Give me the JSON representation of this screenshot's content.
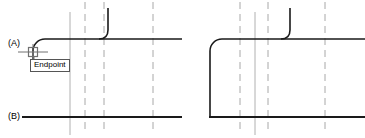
{
  "figure": {
    "width": 365,
    "height": 138,
    "background": "#ffffff"
  },
  "colors": {
    "geometry": "#1a1a1a",
    "centerline": "#a8a8a8",
    "construction_line": "#b0b0b0",
    "tooltip_border": "#555555",
    "tooltip_background": "#ffffff",
    "marker": "#707070",
    "text": "#000000"
  },
  "labels": {
    "point_a": "(A)",
    "point_b": "(B)"
  },
  "tooltip": {
    "text": "Endpoint",
    "visible": true
  },
  "snap": {
    "type": "endpoint-snap-marker",
    "shape": "square",
    "x": 33,
    "y": 52
  },
  "cursor": {
    "type": "crosshair",
    "x": 33,
    "y": 52
  },
  "panels": [
    {
      "name": "panel-before",
      "description": "Open corner with fillet arc being placed; endpoint snap active at lower left",
      "x_origin": 0
    },
    {
      "name": "panel-after",
      "description": "Completed rounded corner joining top and bottom edges",
      "x_origin": 183
    }
  ],
  "geometry": {
    "top_edge_y": 39,
    "bottom_edge_y": 117,
    "left_panel": {
      "fillet_center_x": 45,
      "fillet_center_y": 51,
      "fillet_radius": 12,
      "top_line_start_x": 45,
      "top_line_end_x": 182,
      "bottom_line_start_x": 22,
      "bottom_line_end_x": 182,
      "vertical_stub_x": 33,
      "vertical_stub_top_y": 46,
      "vertical_stub_bottom_y": 60,
      "hook_x": 108,
      "hook_top_y": 8
    },
    "right_panel": {
      "fillet_center_x": 222,
      "fillet_center_y": 51,
      "fillet_radius": 12,
      "left_edge_x": 210,
      "top_line_start_x": 222,
      "top_line_end_x": 365,
      "bottom_line_start_x": 210,
      "bottom_line_end_x": 365,
      "hook_x": 290,
      "hook_top_y": 8
    }
  },
  "centerlines": {
    "dashed": [
      {
        "name": "centerline-left-1",
        "x": 85,
        "y1": 2,
        "y2": 130
      },
      {
        "name": "centerline-left-2",
        "x": 104,
        "y1": 2,
        "y2": 130
      },
      {
        "name": "centerline-left-3",
        "x": 153,
        "y1": 2,
        "y2": 130
      },
      {
        "name": "centerline-right-1",
        "x": 240,
        "y1": 2,
        "y2": 130
      },
      {
        "name": "centerline-right-2",
        "x": 268,
        "y1": 2,
        "y2": 130
      },
      {
        "name": "centerline-right-3",
        "x": 325,
        "y1": 2,
        "y2": 130
      }
    ],
    "solid": [
      {
        "name": "construction-line-left",
        "x": 70,
        "y1": 12,
        "y2": 135
      },
      {
        "name": "construction-line-right",
        "x": 255,
        "y1": 12,
        "y2": 135
      }
    ]
  }
}
